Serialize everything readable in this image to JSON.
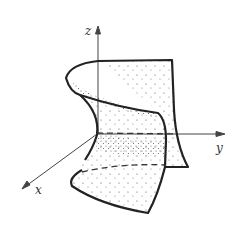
{
  "diagram": {
    "type": "3d-surface-saddle",
    "axes": {
      "x_label": "x",
      "y_label": "y",
      "z_label": "z"
    },
    "colors": {
      "line": "#222222",
      "axis": "#444444",
      "background": "#ffffff"
    }
  }
}
